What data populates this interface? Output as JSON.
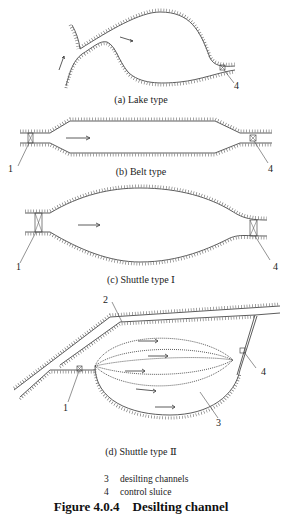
{
  "diagrams": {
    "a": {
      "caption": "(a) Lake type",
      "labels": [
        "4"
      ]
    },
    "b": {
      "caption": "(b) Belt type",
      "labels": [
        "1",
        "4"
      ]
    },
    "c": {
      "caption": "(c) Shuttle type Ⅰ",
      "labels": [
        "1",
        "4"
      ]
    },
    "d": {
      "caption": "(d) Shuttle type Ⅱ",
      "labels": [
        "2",
        "4",
        "1",
        "3"
      ]
    }
  },
  "legend": [
    {
      "num": "3",
      "text": "desilting channels"
    },
    {
      "num": "4",
      "text": "control sluice"
    }
  ],
  "figure_title": "Figure 4.0.4    Desilting channel",
  "colors": {
    "line": "#4a4a4a",
    "background": "#ffffff"
  }
}
